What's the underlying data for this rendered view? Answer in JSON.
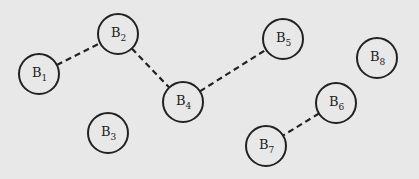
{
  "diagram": {
    "background": "#e8e8e8",
    "stroke_color": "#222222",
    "node_radius": 20,
    "nodes": [
      {
        "id": "B1",
        "base": "B",
        "sub": "1",
        "x": 39,
        "y": 74
      },
      {
        "id": "B2",
        "base": "B",
        "sub": "2",
        "x": 118,
        "y": 34
      },
      {
        "id": "B3",
        "base": "B",
        "sub": "3",
        "x": 108,
        "y": 133
      },
      {
        "id": "B4",
        "base": "B",
        "sub": "4",
        "x": 183,
        "y": 102
      },
      {
        "id": "B5",
        "base": "B",
        "sub": "5",
        "x": 283,
        "y": 39
      },
      {
        "id": "B6",
        "base": "B",
        "sub": "6",
        "x": 336,
        "y": 103
      },
      {
        "id": "B7",
        "base": "B",
        "sub": "7",
        "x": 266,
        "y": 146
      },
      {
        "id": "B8",
        "base": "B",
        "sub": "8",
        "x": 377,
        "y": 58
      }
    ],
    "edges": [
      {
        "from": "B1",
        "to": "B2",
        "style": "dashed"
      },
      {
        "from": "B2",
        "to": "B4",
        "style": "dashed"
      },
      {
        "from": "B4",
        "to": "B5",
        "style": "dashed"
      },
      {
        "from": "B6",
        "to": "B7",
        "style": "dashed"
      }
    ]
  }
}
